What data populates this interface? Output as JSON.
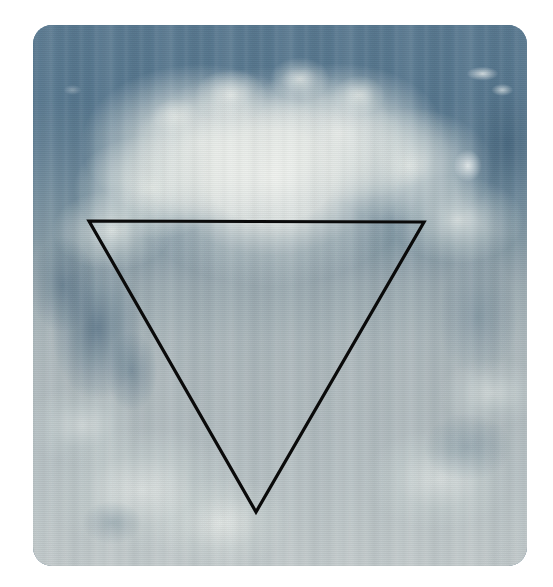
{
  "page": {
    "background_color": "#ffffff",
    "width": 553,
    "height": 587
  },
  "photo": {
    "name": "sky-cloud-photograph",
    "subject": "Large cumulus cloud against blue sky",
    "frame": {
      "left": 33,
      "top": 25,
      "width": 494,
      "height": 541,
      "corner_radius": 19
    },
    "palette": {
      "sky_blue_top": "#4e7089",
      "sky_blue_deep": "#3c5c74",
      "cloud_white": "#eef0ec",
      "cloud_shadow": "#dfe5e0",
      "haze_gray_blue": "#8f9ca2",
      "lower_gray": "#8a979c",
      "background_white": "#ffffff"
    },
    "effects": [
      "vertical-light-banding",
      "halftone-dither-texture",
      "scanlines",
      "rounded-corners"
    ]
  },
  "overlay": {
    "name": "inverted-triangle",
    "shape": "triangle",
    "orientation": "point-down",
    "stroke_color": "#0a0a0a",
    "stroke_width": 3,
    "fill": "none",
    "vertices": [
      {
        "label": "top-left",
        "x": 56,
        "y": 196
      },
      {
        "label": "top-right",
        "x": 391,
        "y": 197
      },
      {
        "label": "bottom",
        "x": 223,
        "y": 487
      }
    ],
    "points_string": "56,196 391,197 223,487"
  }
}
